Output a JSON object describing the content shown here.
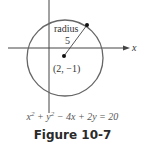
{
  "figure": {
    "caption": "Figure 10-7",
    "equation_parts": [
      "x",
      "2",
      " + y",
      "2",
      " − 4x + 2y = 20"
    ],
    "x_axis_label": "x",
    "radius_label": "radius",
    "radius_value": "5",
    "center_label": "(2, −1)"
  }
}
